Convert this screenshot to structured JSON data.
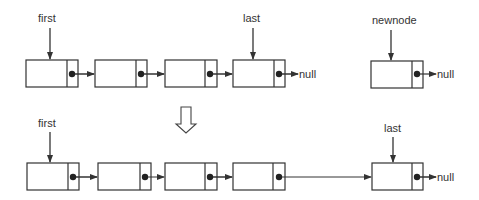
{
  "top_row": {
    "pointers": [
      {
        "label": "first",
        "x": 50,
        "target_x": 50
      },
      {
        "label": "last",
        "x": 253,
        "target_x": 253
      },
      {
        "label": "newnode",
        "x": 396,
        "target_x": 396
      }
    ],
    "nodes": [
      {
        "x": 26,
        "y": 60,
        "w": 52,
        "h": 27
      },
      {
        "x": 95,
        "y": 60,
        "w": 52,
        "h": 27
      },
      {
        "x": 165,
        "y": 60,
        "w": 52,
        "h": 27
      },
      {
        "x": 233,
        "y": 60,
        "w": 52,
        "h": 27
      },
      {
        "x": 371,
        "y": 61,
        "w": 52,
        "h": 27
      }
    ],
    "null_labels": [
      "null",
      "null"
    ]
  },
  "transition_arrow": {
    "icon": "hollow-down-arrow-icon"
  },
  "bottom_row": {
    "pointers": [
      {
        "label": "first",
        "x": 50
      },
      {
        "label": "last",
        "x": 393
      }
    ],
    "nodes": [
      {
        "x": 27,
        "y": 163,
        "w": 52,
        "h": 27
      },
      {
        "x": 98,
        "y": 163,
        "w": 53,
        "h": 27
      },
      {
        "x": 165,
        "y": 163,
        "w": 52,
        "h": 27
      },
      {
        "x": 233,
        "y": 163,
        "w": 52,
        "h": 27
      },
      {
        "x": 372,
        "y": 163,
        "w": 51,
        "h": 27
      }
    ],
    "null_labels": [
      "null"
    ]
  },
  "colors": {
    "stroke": "#333333",
    "fill": "#ffffff",
    "dot": "#222222"
  }
}
